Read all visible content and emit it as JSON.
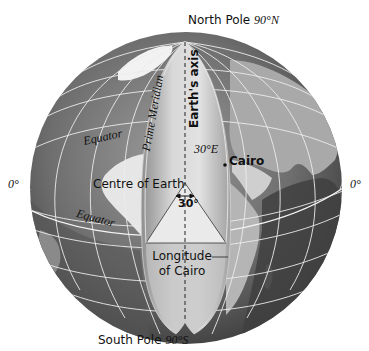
{
  "diagram": {
    "title": "Longitude of Cairo",
    "labels": {
      "north_pole": "North Pole",
      "north_pole_deg": "90°N",
      "south_pole": "South Pole",
      "south_pole_deg": "90°S",
      "prime_meridian": "Prime Meridian",
      "earths_axis": "Earth's axis",
      "equator_upper": "Equator",
      "equator_lower": "Equator",
      "left_deg": "0°",
      "right_deg": "0°",
      "meridian_30": "30°E",
      "cairo": "Cairo",
      "centre": "Centre of Earth",
      "angle": "30°",
      "longitude_line1": "Longitude",
      "longitude_line2": "of Cairo"
    },
    "colors": {
      "globe_dark": "#4a4a4a",
      "globe_mid": "#7d7d7d",
      "land_light": "#c8c8c8",
      "wedge": "#b9b9b9",
      "wedge_light": "#d9d9d9",
      "grid": "#eeeeee",
      "text": "#111111"
    }
  }
}
